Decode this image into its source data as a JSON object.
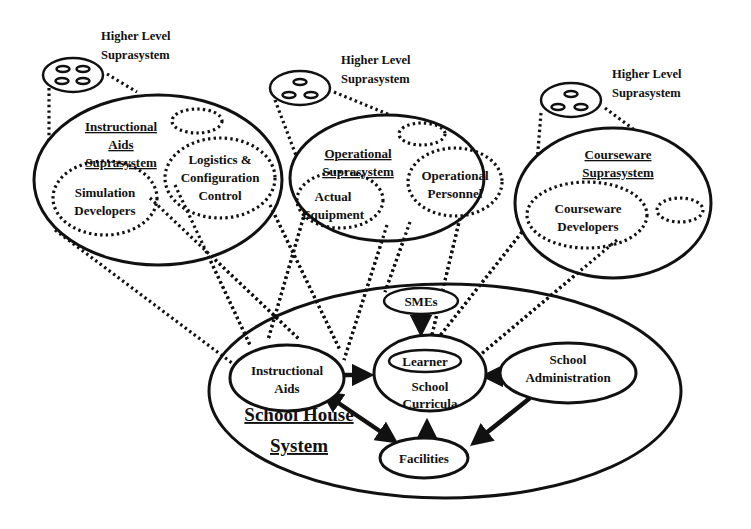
{
  "diagram": {
    "higher_level": [
      {
        "line1": "Higher Level",
        "line2": "Suprasystem"
      },
      {
        "line1": "Higher Level",
        "line2": "Suprasystem"
      },
      {
        "line1": "Higher Level",
        "line2": "Suprasystem"
      }
    ],
    "instructional_aids_suprasystem": {
      "title": [
        "Instructional",
        "Aids",
        "Suprasystem"
      ],
      "logistics": [
        "Logistics &",
        "Configuration",
        "Control"
      ],
      "simulation": [
        "Simulation",
        "Developers"
      ]
    },
    "operational_suprasystem": {
      "title": [
        "Operational",
        "Suprasystem"
      ],
      "equipment": [
        "Actual",
        "Equipment"
      ],
      "personnel": [
        "Operational",
        "Personnel"
      ]
    },
    "courseware_suprasystem": {
      "title": [
        "Courseware",
        "Suprasystem"
      ],
      "developers": [
        "Courseware",
        "Developers"
      ]
    },
    "school_house": {
      "title": [
        "School House",
        "System"
      ],
      "smes": "SMEs",
      "learner": "Learner",
      "curricula": [
        "School",
        "Curricula"
      ],
      "instructional_aids": [
        "Instructional",
        "Aids"
      ],
      "administration": [
        "School",
        "Administration"
      ],
      "facilities": "Facilities"
    }
  }
}
